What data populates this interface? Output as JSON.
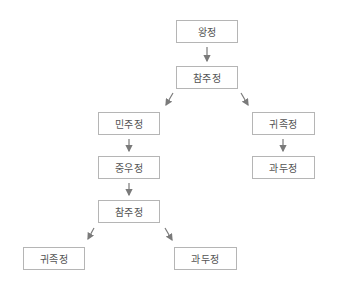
{
  "diagram": {
    "title": "",
    "nodes": [
      {
        "id": "n1",
        "label": "왕정",
        "x": 176,
        "y": 20,
        "w": 62,
        "h": 23
      },
      {
        "id": "n2",
        "label": "참주정",
        "x": 176,
        "y": 66,
        "w": 62,
        "h": 23
      },
      {
        "id": "n3",
        "label": "민주정",
        "x": 98,
        "y": 112,
        "w": 62,
        "h": 23
      },
      {
        "id": "n4",
        "label": "귀족정",
        "x": 252,
        "y": 112,
        "w": 63,
        "h": 23
      },
      {
        "id": "n5",
        "label": "중우정",
        "x": 98,
        "y": 156,
        "w": 62,
        "h": 23
      },
      {
        "id": "n6",
        "label": "과두정",
        "x": 252,
        "y": 156,
        "w": 63,
        "h": 23
      },
      {
        "id": "n7",
        "label": "참주정",
        "x": 98,
        "y": 200,
        "w": 62,
        "h": 23
      },
      {
        "id": "n8",
        "label": "귀족정",
        "x": 23,
        "y": 247,
        "w": 62,
        "h": 23
      },
      {
        "id": "n9",
        "label": "과두정",
        "x": 174,
        "y": 247,
        "w": 63,
        "h": 23
      }
    ],
    "edges": [
      {
        "from": "n1",
        "to": "n2"
      },
      {
        "from": "n2",
        "to": "n3"
      },
      {
        "from": "n2",
        "to": "n4"
      },
      {
        "from": "n3",
        "to": "n5"
      },
      {
        "from": "n4",
        "to": "n6"
      },
      {
        "from": "n5",
        "to": "n7"
      },
      {
        "from": "n7",
        "to": "n8"
      },
      {
        "from": "n7",
        "to": "n9"
      }
    ],
    "colors": {
      "border": "#b5b5b5",
      "text": "#555555",
      "arrow": "#7a7a7a"
    }
  }
}
